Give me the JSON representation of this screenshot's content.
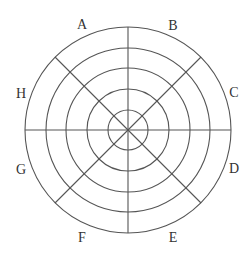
{
  "diagram": {
    "type": "concentric-circles-with-spokes",
    "center": {
      "x": 128,
      "y": 130
    },
    "radii": [
      103,
      82,
      62,
      41,
      20
    ],
    "stroke_color": "#555555",
    "spokes": [
      {
        "name": "horizontal",
        "x1": 25,
        "y1": 130,
        "x2": 231,
        "y2": 130
      },
      {
        "name": "vertical",
        "x1": 128,
        "y1": 27,
        "x2": 128,
        "y2": 233
      },
      {
        "name": "diagonal-nw-se",
        "x1": 55,
        "y1": 57,
        "x2": 201,
        "y2": 203
      },
      {
        "name": "diagonal-ne-sw",
        "x1": 201,
        "y1": 57,
        "x2": 55,
        "y2": 203
      }
    ],
    "labels": [
      {
        "id": "A",
        "text": "A",
        "x": 82,
        "y": 24
      },
      {
        "id": "B",
        "text": "B",
        "x": 173,
        "y": 25
      },
      {
        "id": "C",
        "text": "C",
        "x": 234,
        "y": 92
      },
      {
        "id": "D",
        "text": "D",
        "x": 234,
        "y": 168
      },
      {
        "id": "E",
        "text": "E",
        "x": 173,
        "y": 237
      },
      {
        "id": "F",
        "text": "F",
        "x": 82,
        "y": 237
      },
      {
        "id": "G",
        "text": "G",
        "x": 21,
        "y": 169
      },
      {
        "id": "H",
        "text": "H",
        "x": 21,
        "y": 93
      }
    ]
  }
}
